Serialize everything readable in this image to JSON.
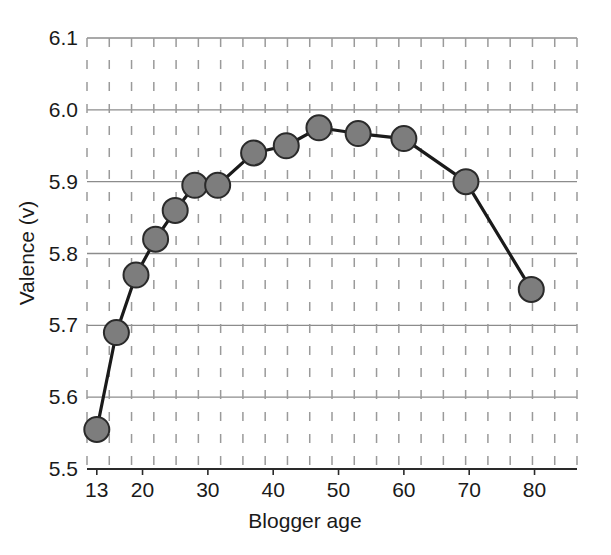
{
  "chart_data": {
    "type": "line",
    "title": "",
    "xlabel": "Blogger age",
    "ylabel": "Valence (v)",
    "xlim": [
      11.5,
      86.5
    ],
    "ylim": [
      5.5,
      6.1
    ],
    "grid": true,
    "grid_style": "solid horizontal gridlines, dashed vertical gridlines",
    "legend": "none",
    "marker": "filled-circle",
    "marker_color": "#7d7d7d",
    "marker_edge_color": "#2a2a2a",
    "line_color": "#1a1a1a",
    "x_tick_labels": [
      "13",
      "20",
      "30",
      "40",
      "50",
      "60",
      "70",
      "80"
    ],
    "x_tick_values": [
      13,
      20,
      30,
      40,
      50,
      60,
      70,
      80
    ],
    "y_tick_labels": [
      "5.5",
      "5.6",
      "5.7",
      "5.8",
      "5.9",
      "6.0",
      "6.1"
    ],
    "y_tick_values": [
      5.5,
      5.6,
      5.7,
      5.8,
      5.9,
      6.0,
      6.1
    ],
    "x": [
      13,
      16,
      19,
      22,
      25,
      28,
      31.5,
      37,
      42,
      47,
      53,
      60,
      69.5,
      79.5
    ],
    "values": [
      5.555,
      5.69,
      5.77,
      5.82,
      5.86,
      5.895,
      5.895,
      5.94,
      5.95,
      5.975,
      5.967,
      5.96,
      5.9,
      5.75
    ],
    "series": [
      {
        "name": "Valence by blogger age",
        "points": [
          {
            "x": 13,
            "y": 5.555
          },
          {
            "x": 16,
            "y": 5.69
          },
          {
            "x": 19,
            "y": 5.77
          },
          {
            "x": 22,
            "y": 5.82
          },
          {
            "x": 25,
            "y": 5.86
          },
          {
            "x": 28,
            "y": 5.895
          },
          {
            "x": 31.5,
            "y": 5.895
          },
          {
            "x": 37,
            "y": 5.94
          },
          {
            "x": 42,
            "y": 5.95
          },
          {
            "x": 47,
            "y": 5.975
          },
          {
            "x": 53,
            "y": 5.967
          },
          {
            "x": 60,
            "y": 5.96
          },
          {
            "x": 69.5,
            "y": 5.9
          },
          {
            "x": 79.5,
            "y": 5.75
          }
        ]
      }
    ]
  },
  "axes": {
    "x_title": "Blogger age",
    "y_title": "Valence (v)"
  }
}
